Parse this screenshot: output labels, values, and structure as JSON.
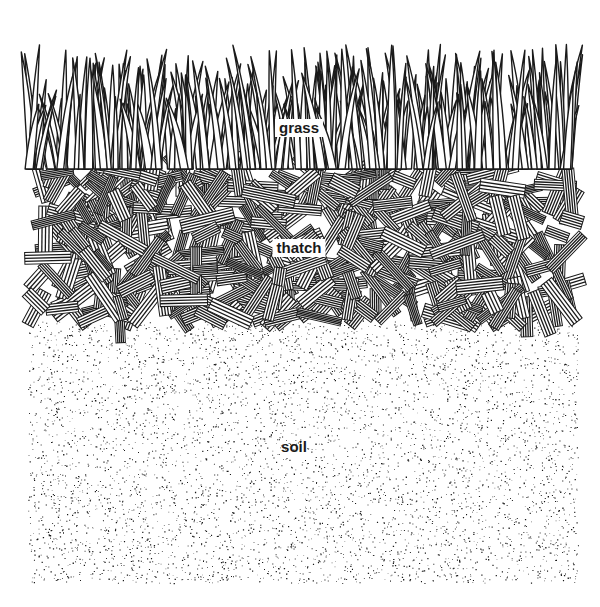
{
  "diagram": {
    "colors": {
      "ink": "#1a1a1a",
      "paper": "#ffffff"
    },
    "layers": [
      {
        "id": "grass",
        "label": "grass",
        "top": 42,
        "bottom": 165,
        "label_x": 299,
        "label_y": 128,
        "font_size": 15
      },
      {
        "id": "thatch",
        "label": "thatch",
        "top": 163,
        "bottom": 322,
        "label_x": 299,
        "label_y": 248,
        "font_size": 15
      },
      {
        "id": "soil",
        "label": "soil",
        "top": 318,
        "bottom": 583,
        "label_x": 294,
        "label_y": 447,
        "font_size": 15
      }
    ],
    "bounds": {
      "left": 28,
      "right": 578
    },
    "render": {
      "grass_blades": 260,
      "thatch_bundles": 420,
      "soil_dots": 5200,
      "seed": 17
    }
  }
}
